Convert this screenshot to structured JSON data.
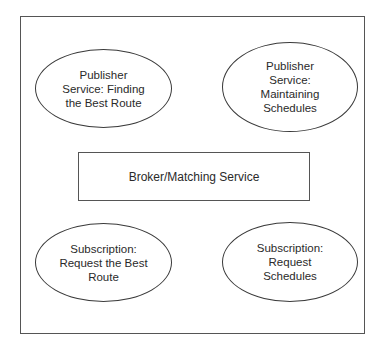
{
  "diagram": {
    "type": "publish-subscribe architecture",
    "colors": {
      "background": "#ffffff",
      "stroke": "#555555",
      "text": "#2a2a2a"
    },
    "center": {
      "shape": "rectangle",
      "label": "Broker/Matching Service"
    },
    "nodes": [
      {
        "id": "publisher-best-route",
        "shape": "ellipse",
        "position": "top-left",
        "label": "Publisher\nService: Finding\nthe Best Route"
      },
      {
        "id": "publisher-schedules",
        "shape": "ellipse",
        "position": "top-right",
        "label": "Publisher\nService:\nMaintaining\nSchedules"
      },
      {
        "id": "subscription-best-route",
        "shape": "ellipse",
        "position": "bottom-left",
        "label": "Subscription:\nRequest the Best\nRoute"
      },
      {
        "id": "subscription-schedules",
        "shape": "ellipse",
        "position": "bottom-right",
        "label": "Subscription:\nRequest\nSchedules"
      }
    ],
    "edges": []
  }
}
